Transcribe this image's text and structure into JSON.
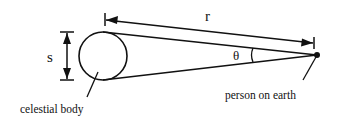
{
  "diagram": {
    "labels": {
      "size": "s",
      "distance": "r",
      "angle": "θ",
      "body": "celestial body",
      "observer": "person on earth"
    },
    "colors": {
      "stroke": "#111111",
      "background": "#ffffff"
    }
  }
}
